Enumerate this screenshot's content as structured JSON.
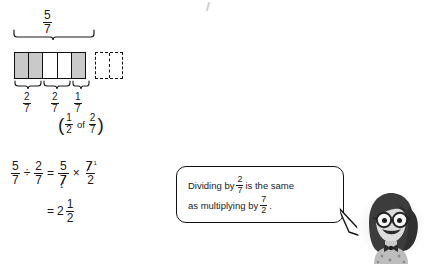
{
  "bar_model": {
    "top_label": {
      "numerator": "5",
      "denominator": "7"
    },
    "cells": [
      {
        "name": "cell-1",
        "shaded": true
      },
      {
        "name": "cell-2",
        "shaded": true
      },
      {
        "name": "cell-3",
        "shaded": false
      },
      {
        "name": "cell-4",
        "shaded": false
      },
      {
        "name": "cell-5",
        "shaded": true
      }
    ],
    "dashed_box": {
      "halves": 2
    },
    "group_labels": [
      {
        "numerator": "2",
        "denominator": "7"
      },
      {
        "numerator": "2",
        "denominator": "7"
      },
      {
        "numerator": "1",
        "denominator": "7"
      }
    ],
    "paren_note": {
      "open": "(",
      "fraction_first": {
        "numerator": "1",
        "denominator": "2"
      },
      "connector": "of",
      "fraction_second": {
        "numerator": "2",
        "denominator": "7"
      },
      "close": ")"
    }
  },
  "equation": {
    "line1": {
      "left_fraction": {
        "numerator": "5",
        "denominator": "7"
      },
      "divide_sign": "÷",
      "right_fraction": {
        "numerator": "2",
        "denominator": "7"
      },
      "equals": "=",
      "result_first": {
        "numerator": "5",
        "denominator": "7",
        "denominator_cancelled": true
      },
      "times_sign": "×",
      "result_second": {
        "numerator": "7",
        "denominator": "2",
        "numerator_cancelled": true,
        "numerator_exponent": "1"
      },
      "cancel_one": "1"
    },
    "line2": {
      "equals": "=",
      "whole": "2",
      "fraction": {
        "numerator": "1",
        "denominator": "2"
      }
    }
  },
  "speech_bubble": {
    "line1_before": "Dividing by",
    "line1_fraction": {
      "numerator": "2",
      "denominator": "7"
    },
    "line1_after": "is the same",
    "line2_before": "as multiplying by",
    "line2_fraction": {
      "numerator": "7",
      "denominator": "2"
    },
    "line2_after": "."
  },
  "character": {
    "description": "girl-with-glasses-avatar"
  },
  "colors": {
    "ink": "#1a1a1a",
    "shaded_cell": "#c9c9c9",
    "background": "#ffffff"
  }
}
